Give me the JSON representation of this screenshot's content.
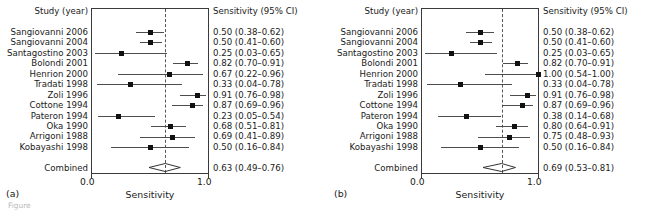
{
  "figure": {
    "caption_partial": "Figure",
    "panels": [
      {
        "tag": "(a)",
        "study_header": "Study (year)",
        "value_header": "Sensitivity (95% CI)",
        "axis_title": "Sensitivity",
        "axis_ticks": [
          "0.0",
          "1.0"
        ],
        "combined_label": "Combined",
        "combined_value_text": "0.63 (0.49–0.76)",
        "rows": [
          {
            "label": "Sangiovanni 2006",
            "value_text": "0.50 (0.38–0.62)"
          },
          {
            "label": "Sangiovanni 2004",
            "value_text": "0.50 (0.41–0.60)"
          },
          {
            "label": "Santagostino 2003",
            "value_text": "0.25 (0.03–0.65)"
          },
          {
            "label": "Bolondi 2001",
            "value_text": "0.82 (0.70–0.91)"
          },
          {
            "label": "Henrion 2000",
            "value_text": "0.67 (0.22–0.96)"
          },
          {
            "label": "Tradati 1998",
            "value_text": "0.33 (0.04–0.78)"
          },
          {
            "label": "Zoli 1996",
            "value_text": "0.91 (0.76–0.98)"
          },
          {
            "label": "Cottone 1994",
            "value_text": "0.87 (0.69–0.96)"
          },
          {
            "label": "Pateron 1994",
            "value_text": "0.23 (0.05–0.54)"
          },
          {
            "label": "Oka 1990",
            "value_text": "0.68 (0.51–0.81)"
          },
          {
            "label": "Arrigoni 1988",
            "value_text": "0.69 (0.41–0.89)"
          },
          {
            "label": "Kobayashi 1998",
            "value_text": "0.50 (0.16–0.84)"
          }
        ]
      },
      {
        "tag": "(b)",
        "study_header": "Study (year)",
        "value_header": "Sensitivity (95% CI)",
        "axis_title": "Sensitivity",
        "axis_ticks": [
          "0.0",
          "1.0"
        ],
        "combined_label": "Combined",
        "combined_value_text": "0.69 (0.53–0.81)",
        "rows": [
          {
            "label": "Sangiovanni 2006",
            "value_text": "0.50 (0.38–0.62)"
          },
          {
            "label": "Sangiovanni 2004",
            "value_text": "0.50 (0.41–0.60)"
          },
          {
            "label": "Santagostino 2003",
            "value_text": "0.25 (0.03–0.65)"
          },
          {
            "label": "Bolondi 2001",
            "value_text": "0.82 (0.70–0.91)"
          },
          {
            "label": "Henrion 2000",
            "value_text": "1.00 (0.54–1.00)"
          },
          {
            "label": "Tradati 1998",
            "value_text": "0.33 (0.04–0.78)"
          },
          {
            "label": "Zoli 1996",
            "value_text": "0.91 (0.76–0.98)"
          },
          {
            "label": "Cottone 1994",
            "value_text": "0.87 (0.69–0.96)"
          },
          {
            "label": "Pateron 1994",
            "value_text": "0.38 (0.14–0.68)"
          },
          {
            "label": "Oka 1990",
            "value_text": "0.80 (0.64–0.91)"
          },
          {
            "label": "Arrigoni 1988",
            "value_text": "0.75 (0.48–0.93)"
          },
          {
            "label": "Kobayashi 1998",
            "value_text": "0.50 (0.16–0.84)"
          }
        ]
      }
    ]
  },
  "chart_data": [
    {
      "type": "forest",
      "panel": "a",
      "title": "",
      "xlabel": "Sensitivity",
      "ylabel": "",
      "xlim": [
        0.0,
        1.0
      ],
      "xticks": [
        0.0,
        1.0
      ],
      "grid": false,
      "reference_line": 0.63,
      "columns": [
        "Study (year)",
        "Sensitivity (95% CI)"
      ],
      "studies": [
        {
          "label": "Sangiovanni 2006",
          "estimate": 0.5,
          "ci_low": 0.38,
          "ci_high": 0.62
        },
        {
          "label": "Sangiovanni 2004",
          "estimate": 0.5,
          "ci_low": 0.41,
          "ci_high": 0.6
        },
        {
          "label": "Santagostino 2003",
          "estimate": 0.25,
          "ci_low": 0.03,
          "ci_high": 0.65
        },
        {
          "label": "Bolondi 2001",
          "estimate": 0.82,
          "ci_low": 0.7,
          "ci_high": 0.91
        },
        {
          "label": "Henrion 2000",
          "estimate": 0.67,
          "ci_low": 0.22,
          "ci_high": 0.96
        },
        {
          "label": "Tradati 1998",
          "estimate": 0.33,
          "ci_low": 0.04,
          "ci_high": 0.78
        },
        {
          "label": "Zoli 1996",
          "estimate": 0.91,
          "ci_low": 0.76,
          "ci_high": 0.98
        },
        {
          "label": "Cottone 1994",
          "estimate": 0.87,
          "ci_low": 0.69,
          "ci_high": 0.96
        },
        {
          "label": "Pateron 1994",
          "estimate": 0.23,
          "ci_low": 0.05,
          "ci_high": 0.54
        },
        {
          "label": "Oka 1990",
          "estimate": 0.68,
          "ci_low": 0.51,
          "ci_high": 0.81
        },
        {
          "label": "Arrigoni 1988",
          "estimate": 0.69,
          "ci_low": 0.41,
          "ci_high": 0.89
        },
        {
          "label": "Kobayashi 1998",
          "estimate": 0.5,
          "ci_low": 0.16,
          "ci_high": 0.84
        }
      ],
      "combined": {
        "label": "Combined",
        "estimate": 0.63,
        "ci_low": 0.49,
        "ci_high": 0.76
      }
    },
    {
      "type": "forest",
      "panel": "b",
      "title": "",
      "xlabel": "Sensitivity",
      "ylabel": "",
      "xlim": [
        0.0,
        1.0
      ],
      "xticks": [
        0.0,
        1.0
      ],
      "grid": false,
      "reference_line": 0.69,
      "columns": [
        "Study (year)",
        "Sensitivity (95% CI)"
      ],
      "studies": [
        {
          "label": "Sangiovanni 2006",
          "estimate": 0.5,
          "ci_low": 0.38,
          "ci_high": 0.62
        },
        {
          "label": "Sangiovanni 2004",
          "estimate": 0.5,
          "ci_low": 0.41,
          "ci_high": 0.6
        },
        {
          "label": "Santagostino 2003",
          "estimate": 0.25,
          "ci_low": 0.03,
          "ci_high": 0.65
        },
        {
          "label": "Bolondi 2001",
          "estimate": 0.82,
          "ci_low": 0.7,
          "ci_high": 0.91
        },
        {
          "label": "Henrion 2000",
          "estimate": 1.0,
          "ci_low": 0.54,
          "ci_high": 1.0
        },
        {
          "label": "Tradati 1998",
          "estimate": 0.33,
          "ci_low": 0.04,
          "ci_high": 0.78
        },
        {
          "label": "Zoli 1996",
          "estimate": 0.91,
          "ci_low": 0.76,
          "ci_high": 0.98
        },
        {
          "label": "Cottone 1994",
          "estimate": 0.87,
          "ci_low": 0.69,
          "ci_high": 0.96
        },
        {
          "label": "Pateron 1994",
          "estimate": 0.38,
          "ci_low": 0.14,
          "ci_high": 0.68
        },
        {
          "label": "Oka 1990",
          "estimate": 0.8,
          "ci_low": 0.64,
          "ci_high": 0.91
        },
        {
          "label": "Arrigoni 1988",
          "estimate": 0.75,
          "ci_low": 0.48,
          "ci_high": 0.93
        },
        {
          "label": "Kobayashi 1998",
          "estimate": 0.5,
          "ci_low": 0.16,
          "ci_high": 0.84
        }
      ],
      "combined": {
        "label": "Combined",
        "estimate": 0.69,
        "ci_low": 0.53,
        "ci_high": 0.81
      }
    }
  ]
}
